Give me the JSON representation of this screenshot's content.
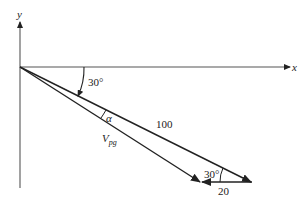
{
  "diagram": {
    "axes": {
      "x_label": "x",
      "y_label": "y"
    },
    "angles": {
      "top_angle": "30°",
      "alpha": "α",
      "bottom_angle": "30°"
    },
    "vectors": {
      "main_magnitude": "100",
      "small_magnitude": "20",
      "resultant_label": "V",
      "resultant_subscript": "pg"
    },
    "colors": {
      "line": "#222222",
      "axis": "#555555",
      "background": "#ffffff"
    }
  }
}
